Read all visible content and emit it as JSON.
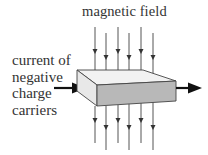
{
  "diagram": {
    "labels": {
      "magnetic_field": "magnetic field",
      "current_lines": [
        "current of",
        "negative",
        "charge",
        "carriers"
      ]
    },
    "elements": {
      "field_lines": {
        "count": 6,
        "direction": "down",
        "color": "#555555"
      },
      "conductor_slab": {
        "top_face_color": "#f2f2f2",
        "side_face_color": "#e6e6e6",
        "front_face_color": "#b8b8b8",
        "edge_color": "#444444"
      },
      "current_arrow": {
        "direction": "right",
        "color": "#111111"
      }
    }
  }
}
